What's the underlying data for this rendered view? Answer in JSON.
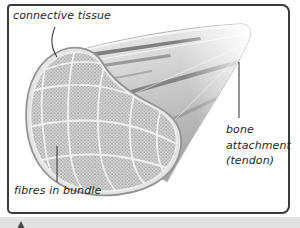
{
  "diagram": {
    "labels": {
      "connective_tissue": "connective tissue",
      "fibres_in_bundle": "fibres in bundle",
      "bone_attachment_lines": [
        "bone",
        "attachment",
        "(tendon)"
      ]
    },
    "colors": {
      "frame_border": "#3b3b3b",
      "label_text": "#262626",
      "leader_line": "#3f3f3f",
      "muscle_light": "#f0f0f0",
      "muscle_mid": "#c9c9c9",
      "muscle_dark": "#a3a3a3",
      "muscle_streak_dark": "#6e6e6e",
      "tendon_white": "#ffffff",
      "cross_section_base": "#d4d4d4",
      "cross_section_dot": "#949494",
      "fascicle_border": "#f1f1f1",
      "rim_outline": "#949494",
      "page_edge_strip": "#e2e2e2"
    }
  }
}
